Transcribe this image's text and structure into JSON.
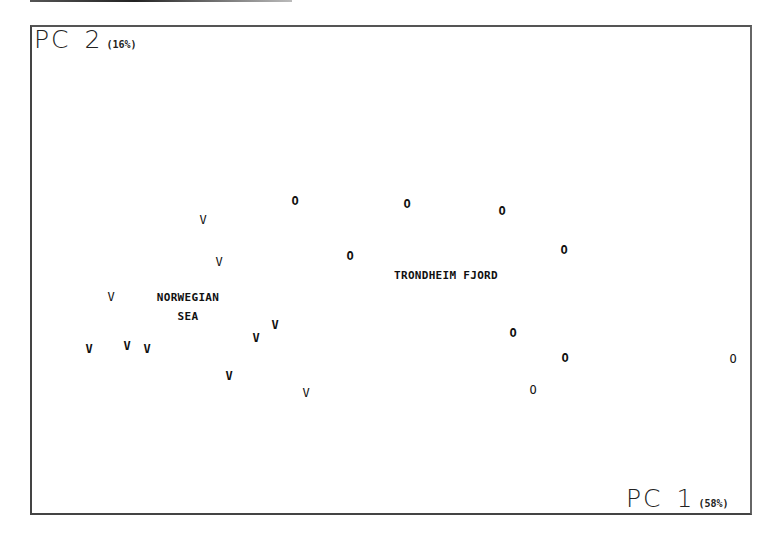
{
  "chart_data": {
    "type": "scatter",
    "title": "",
    "xlabel": "PC 1 (58%)",
    "ylabel": "PC 2 (16%)",
    "x_axis": {
      "name": "PC",
      "number": "1",
      "variance": "(58%)"
    },
    "y_axis": {
      "name": "PC",
      "number": "2",
      "variance": "(16%)"
    },
    "grid": false,
    "ticks_shown": false,
    "series": [
      {
        "name": "Norwegian Sea",
        "marker": "V",
        "label_lines": [
          "NORWEGIAN",
          "SEA"
        ],
        "points_px": [
          {
            "x": 203,
            "y": 220,
            "bold": false
          },
          {
            "x": 219,
            "y": 262,
            "bold": false
          },
          {
            "x": 111,
            "y": 297,
            "bold": false
          },
          {
            "x": 89,
            "y": 349,
            "bold": true
          },
          {
            "x": 127,
            "y": 346,
            "bold": true
          },
          {
            "x": 147,
            "y": 349,
            "bold": true
          },
          {
            "x": 256,
            "y": 338,
            "bold": true
          },
          {
            "x": 275,
            "y": 325,
            "bold": true
          },
          {
            "x": 229,
            "y": 376,
            "bold": true
          },
          {
            "x": 306,
            "y": 393,
            "bold": false
          }
        ]
      },
      {
        "name": "Trondheim Fjord",
        "marker": "O",
        "label_lines": [
          "TRONDHEIM FJORD"
        ],
        "points_px": [
          {
            "x": 295,
            "y": 201,
            "bold": true
          },
          {
            "x": 407,
            "y": 204,
            "bold": true
          },
          {
            "x": 502,
            "y": 211,
            "bold": true
          },
          {
            "x": 350,
            "y": 256,
            "bold": true
          },
          {
            "x": 564,
            "y": 250,
            "bold": true
          },
          {
            "x": 513,
            "y": 333,
            "bold": true
          },
          {
            "x": 565,
            "y": 358,
            "bold": true
          },
          {
            "x": 533,
            "y": 390,
            "bold": false
          },
          {
            "x": 733,
            "y": 359,
            "bold": false
          }
        ]
      }
    ],
    "annotations": [
      {
        "text": "NORWEGIAN SEA",
        "x_px": 188,
        "y_px": 307
      },
      {
        "text": "TRONDHEIM FJORD",
        "x_px": 446,
        "y_px": 275
      }
    ]
  },
  "labels": {
    "norwegian": "NORWEGIAN",
    "sea": "SEA",
    "trondheim": "TRONDHEIM FJORD"
  }
}
